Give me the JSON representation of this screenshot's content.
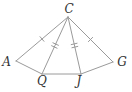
{
  "figure": {
    "background_color": "#ffffff",
    "line_color": "#9a9a9a",
    "label_color": "#333333",
    "width": 132,
    "height": 92,
    "vertices": {
      "C": {
        "label": "C",
        "x": 68,
        "y": 17,
        "label_x": 69,
        "label_y": 12.5
      },
      "A": {
        "label": "A",
        "x": 16,
        "y": 61,
        "label_x": 6.5,
        "label_y": 66
      },
      "Q": {
        "label": "Q",
        "x": 42,
        "y": 74,
        "label_x": 42,
        "label_y": 85
      },
      "J": {
        "label": "J",
        "x": 81,
        "y": 74,
        "label_x": 79,
        "label_y": 85
      },
      "G": {
        "label": "G",
        "x": 113,
        "y": 62,
        "label_x": 122,
        "label_y": 66
      }
    },
    "segments": [
      {
        "from": "C",
        "to": "A",
        "ticks": 1
      },
      {
        "from": "C",
        "to": "Q",
        "ticks": 2
      },
      {
        "from": "C",
        "to": "J",
        "ticks": 2
      },
      {
        "from": "C",
        "to": "G",
        "ticks": 1
      },
      {
        "from": "A",
        "to": "Q",
        "ticks": 0
      },
      {
        "from": "Q",
        "to": "J",
        "ticks": 0
      },
      {
        "from": "J",
        "to": "G",
        "ticks": 0
      }
    ],
    "tick_half_length": 3,
    "tick_spacing": 3.2
  }
}
